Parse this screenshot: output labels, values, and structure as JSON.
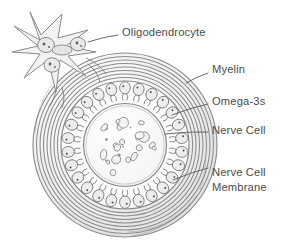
{
  "figure": {
    "background_color": "#ffffff",
    "line_color": "#8a8a8a",
    "text_color": "#4c4c4c",
    "style": "pencil-sketch scientific illustration"
  },
  "labels": [
    {
      "id": "oligodendrocyte",
      "text": "Oligodendrocyte",
      "x": 122,
      "y": 33,
      "anchor": "start",
      "lines": [
        "Oligodendrocyte"
      ]
    },
    {
      "id": "myelin",
      "text": "Myelin",
      "x": 212,
      "y": 70,
      "anchor": "start",
      "lines": [
        "Myelin"
      ]
    },
    {
      "id": "omega-3s",
      "text": "Omega-3s",
      "x": 212,
      "y": 102,
      "anchor": "start",
      "lines": [
        "Omega-3s"
      ]
    },
    {
      "id": "nerve-cell",
      "text": "Nerve Cell",
      "x": 212,
      "y": 131,
      "anchor": "start",
      "lines": [
        "Nerve Cell"
      ]
    },
    {
      "id": "nerve-cell-membrane",
      "text": "Nerve Cell Membrane",
      "x": 212,
      "y": 173,
      "anchor": "start",
      "lines": [
        "Nerve Cell",
        "Membrane"
      ]
    }
  ],
  "structures": {
    "oligodendrocyte": {
      "name": "Oligodendrocyte",
      "description": "star-shaped glial cell with radiating processes",
      "center_x": 58,
      "center_y": 48,
      "nuclei_count": 3,
      "arm_count": 6
    },
    "myelin": {
      "name": "Myelin",
      "description": "concentric wrapped sheath layers",
      "center_x": 125,
      "center_y": 145,
      "layer_count": 8,
      "outer_radius": 92,
      "inner_radius": 66
    },
    "omega3_ring": {
      "name": "Omega-3s",
      "description": "ring of omega-3 fatty acid molecules in the membrane",
      "center_x": 125,
      "center_y": 145,
      "radius": 54,
      "molecule_count": 26
    },
    "nerve_cell": {
      "name": "Nerve Cell",
      "description": "axoplasm interior containing organelle blobs",
      "center_x": 125,
      "center_y": 145,
      "radius": 41,
      "blob_count": 22
    },
    "nerve_cell_membrane": {
      "name": "Nerve Cell Membrane",
      "description": "boundary enclosing the omega-3 molecule ring",
      "center_x": 125,
      "center_y": 145,
      "radius": 64
    }
  },
  "leaders": [
    {
      "id": "leader-oligodendrocyte",
      "from_x": 118,
      "from_y": 35,
      "to_x": 88,
      "to_y": 42
    },
    {
      "id": "leader-myelin",
      "from_x": 208,
      "from_y": 73,
      "to_x": 186,
      "to_y": 83
    },
    {
      "id": "leader-omega3s",
      "from_x": 208,
      "from_y": 104,
      "to_x": 172,
      "to_y": 115
    },
    {
      "id": "leader-nerve-cell",
      "from_x": 208,
      "from_y": 132,
      "to_x": 165,
      "to_y": 134
    },
    {
      "id": "leader-nerve-cell-membrane",
      "from_x": 208,
      "from_y": 168,
      "to_x": 173,
      "to_y": 180
    }
  ]
}
